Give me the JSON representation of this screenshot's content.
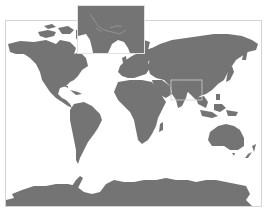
{
  "map": {
    "type": "world-map",
    "projection": "cylindrical",
    "colors": {
      "land": "#747474",
      "water": "#ffffff",
      "frame": "#d4d4d4",
      "inset_frame": "#e2e2e2",
      "inset_bg": "#747474",
      "rivers": "#a8a8a8"
    },
    "inset": {
      "region": "South Asia (India)",
      "position": "top-center"
    },
    "highlight_box": {
      "region": "India"
    },
    "continents": [
      "North America",
      "South America",
      "Europe",
      "Africa",
      "Asia",
      "Australia",
      "Antarctica"
    ]
  }
}
